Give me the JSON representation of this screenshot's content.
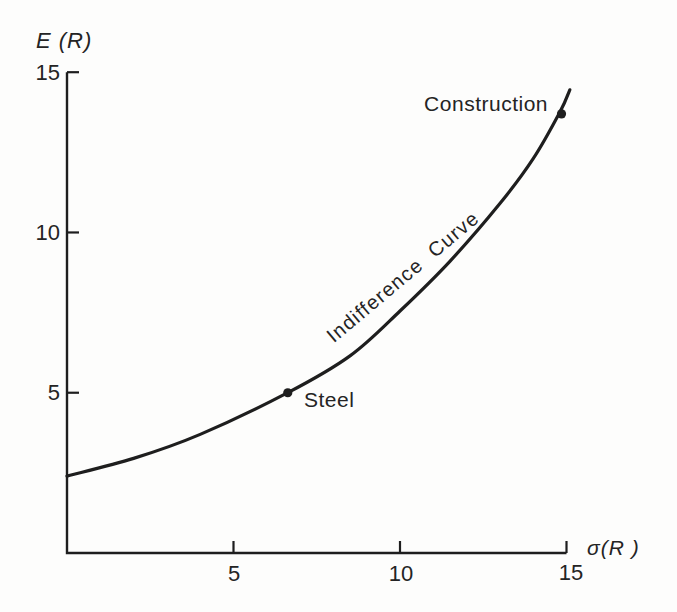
{
  "page": {
    "background_color": "#fdfdfc",
    "ink_color": "#1e1e1e"
  },
  "chart_data": {
    "type": "line",
    "title": "",
    "xlabel": "σ(R )",
    "ylabel": "E (R)",
    "xlim": [
      0,
      15.3
    ],
    "ylim": [
      0,
      15
    ],
    "x_ticks": [
      5,
      10,
      15
    ],
    "y_ticks": [
      5,
      10,
      15
    ],
    "x_tick_labels": [
      "5",
      "10",
      "15"
    ],
    "y_tick_labels": [
      "5",
      "10",
      "15"
    ],
    "grid": false,
    "legend_position": "none",
    "series": [
      {
        "name": "Indifference Curve",
        "points": [
          [
            0,
            2.4
          ],
          [
            2,
            2.95
          ],
          [
            4,
            3.7
          ],
          [
            6.63,
            5.0
          ],
          [
            8.5,
            6.15
          ],
          [
            10,
            7.55
          ],
          [
            11.5,
            9.1
          ],
          [
            13,
            10.9
          ],
          [
            14,
            12.3
          ],
          [
            14.8,
            13.75
          ],
          [
            15.1,
            14.45
          ]
        ]
      }
    ],
    "annotations": [
      {
        "label": "Steel",
        "x": 6.63,
        "y": 5.0
      },
      {
        "label": "Construction",
        "x": 14.85,
        "y": 13.7
      }
    ],
    "curve_label": {
      "text": "Indifference Curve",
      "x": 9.5,
      "y": 8.6,
      "rotation_deg": -40
    }
  }
}
